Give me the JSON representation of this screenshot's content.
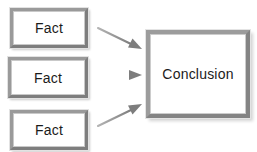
{
  "diagram": {
    "type": "flow-diagram",
    "background_color": "#ffffff",
    "box_border_color": "#8a8a8a",
    "box_fill_color": "#ffffff",
    "arrow_color": "#8e8e8e",
    "text_color": "#1b1b1b",
    "facts": [
      {
        "id": "fact-1",
        "label": "Fact"
      },
      {
        "id": "fact-2",
        "label": "Fact"
      },
      {
        "id": "fact-3",
        "label": "Fact"
      }
    ],
    "conclusion": {
      "id": "conclusion",
      "label": "Conclusion"
    },
    "arrows": [
      {
        "id": "arrow-fact-1-to-conclusion",
        "direction": "down-right",
        "from": "fact-1",
        "to": "conclusion"
      },
      {
        "id": "arrow-fact-2-to-conclusion",
        "direction": "right",
        "from": "fact-2",
        "to": "conclusion"
      },
      {
        "id": "arrow-fact-3-to-conclusion",
        "direction": "up-right",
        "from": "fact-3",
        "to": "conclusion"
      }
    ]
  }
}
